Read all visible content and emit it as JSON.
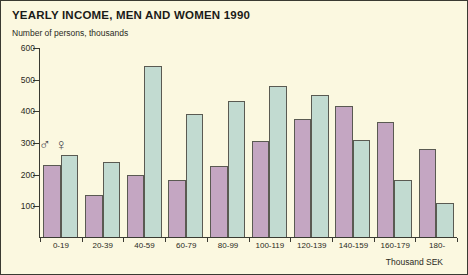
{
  "chart_data": {
    "type": "bar",
    "title": "YEARLY INCOME, MEN AND WOMEN 1990",
    "subtitle": "Number of persons, thousands",
    "xlabel": "Thousand SEK",
    "ylabel": "",
    "ylim": [
      0,
      600
    ],
    "yticks": [
      600,
      500,
      400,
      300,
      200,
      100
    ],
    "grid": false,
    "legend_position": "inside-left",
    "categories": [
      "0-19",
      "20-39",
      "40-59",
      "60-79",
      "80-99",
      "100-119",
      "120-139",
      "140-159",
      "160-179",
      "180-"
    ],
    "series": [
      {
        "name": "Men",
        "symbol": "mars-symbol",
        "glyph": "♂",
        "color": "#c4a6c2",
        "values": [
          228,
          133,
          196,
          180,
          225,
          302,
          372,
          415,
          362,
          277
        ]
      },
      {
        "name": "Women",
        "symbol": "venus-symbol",
        "glyph": "♀",
        "color": "#c2dbd1",
        "values": [
          260,
          238,
          540,
          390,
          428,
          478,
          448,
          305,
          180,
          108
        ]
      }
    ]
  }
}
